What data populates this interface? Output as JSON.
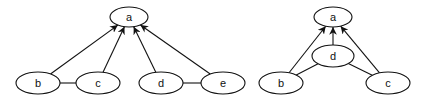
{
  "diagrams": [
    {
      "name": "left-graph",
      "nodes": [
        {
          "id": "a",
          "label": "a",
          "cx": 129,
          "cy": 17,
          "rx": 19,
          "ry": 10
        },
        {
          "id": "b",
          "label": "b",
          "cx": 38,
          "cy": 83,
          "rx": 22,
          "ry": 11
        },
        {
          "id": "c",
          "label": "c",
          "cx": 98,
          "cy": 83,
          "rx": 22,
          "ry": 11
        },
        {
          "id": "d",
          "label": "d",
          "cx": 161,
          "cy": 83,
          "rx": 22,
          "ry": 11
        },
        {
          "id": "e",
          "label": "e",
          "cx": 223,
          "cy": 83,
          "rx": 22,
          "ry": 11
        }
      ],
      "directed_edges": [
        [
          "b",
          "a"
        ],
        [
          "c",
          "a"
        ],
        [
          "d",
          "a"
        ],
        [
          "e",
          "a"
        ]
      ],
      "undirected_edges": [
        [
          "b",
          "c"
        ],
        [
          "d",
          "e"
        ]
      ]
    },
    {
      "name": "right-graph",
      "nodes": [
        {
          "id": "a",
          "label": "a",
          "cx": 333,
          "cy": 17,
          "rx": 19,
          "ry": 10
        },
        {
          "id": "d",
          "label": "d",
          "cx": 333,
          "cy": 56,
          "rx": 21,
          "ry": 11
        },
        {
          "id": "b",
          "label": "b",
          "cx": 281,
          "cy": 83,
          "rx": 22,
          "ry": 11
        },
        {
          "id": "c",
          "label": "c",
          "cx": 388,
          "cy": 83,
          "rx": 22,
          "ry": 11
        }
      ],
      "directed_edges": [
        [
          "b",
          "a"
        ],
        [
          "d",
          "a"
        ],
        [
          "c",
          "a"
        ]
      ],
      "undirected_edges": [
        [
          "d",
          "b"
        ],
        [
          "d",
          "c"
        ]
      ]
    }
  ]
}
